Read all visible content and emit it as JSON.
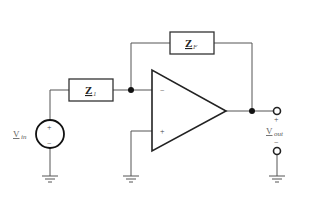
{
  "diagram": {
    "components": {
      "input_impedance": {
        "symbol": "Z",
        "subscript": "1"
      },
      "feedback_impedance": {
        "symbol": "Z",
        "subscript": "F"
      },
      "source": {
        "symbol": "V",
        "subscript": "in",
        "plus": "+",
        "minus": "−"
      },
      "opamp": {
        "inverting_sign": "−",
        "noninverting_sign": "+"
      },
      "output": {
        "symbol": "V",
        "subscript": "out",
        "plus": "+",
        "minus": "−"
      }
    },
    "colors": {
      "wire": "#555555",
      "component": "#222222",
      "label": "#666666"
    }
  }
}
